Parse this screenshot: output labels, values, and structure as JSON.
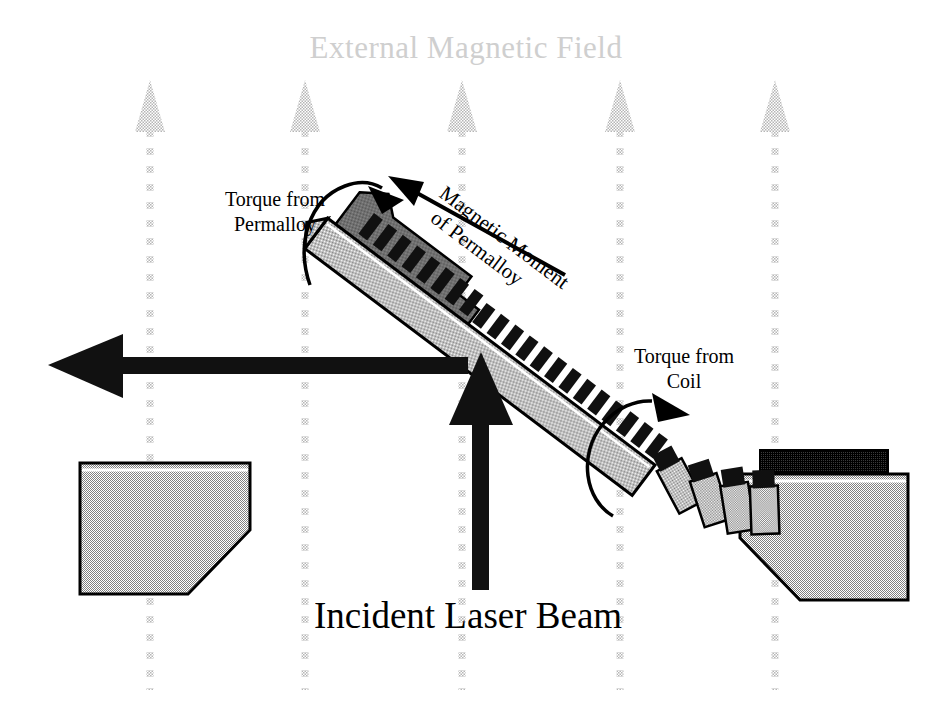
{
  "figure": {
    "title": "External Magnetic Field",
    "beam_label": "Incident Laser Beam",
    "labels": {
      "torque_permalloy_line1": "Torque from",
      "torque_permalloy_line2": "Permalloy",
      "torque_coil_line1": "Torque from",
      "torque_coil_line2": "Coil",
      "magnetic_moment_line1": "Magnetic Moment",
      "magnetic_moment_line2": "of Permalloy"
    },
    "icons": {
      "field_arrow": "field-arrow-up-icon",
      "incident_beam_arrow": "laser-arrow-up-icon",
      "reflected_beam_arrow": "laser-arrow-left-icon",
      "moment_arrow": "magnetic-moment-arrow-icon",
      "torque_permalloy_arc": "curved-torque-arrow-icon",
      "torque_coil_arc": "curved-torque-arrow-icon"
    },
    "colors": {
      "background": "#ffffff",
      "field_arrow": "#d2d2d2",
      "title_text": "#cfcfcf",
      "body_text": "#000000",
      "substrate_gray": "#a8a8a8",
      "permalloy_gray": "#6f6f6f",
      "coil_black": "#141414",
      "outline": "#000000"
    },
    "field_arrows_x": [
      150,
      305,
      462,
      620,
      775
    ],
    "field_arrow_top_y": 78,
    "field_arrow_bottom_y": 690,
    "cantilever": {
      "angle_deg": 37,
      "tip_x": 330,
      "tip_y": 215,
      "base_x": 660,
      "base_y": 462,
      "coil_turns": 22
    },
    "hinge_segments": 4,
    "supports": {
      "left": {
        "x": 78,
        "y": 462,
        "w": 172,
        "h": 132
      },
      "right": {
        "x": 738,
        "y": 452,
        "w": 170,
        "h": 140
      }
    }
  }
}
